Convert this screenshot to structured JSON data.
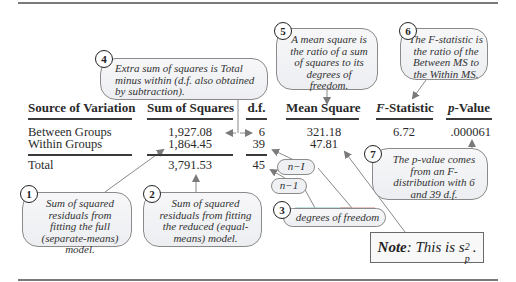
{
  "table": {
    "headers": {
      "source": "Source of Variation",
      "ss": "Sum of Squares",
      "df": "d.f.",
      "ms": "Mean Square",
      "f_prefix": "F",
      "f_suffix": "-Statistic",
      "p_prefix": "p",
      "p_suffix": "-Value"
    },
    "rows": [
      {
        "source": "Between Groups",
        "ss": "1,927.08",
        "df": "6",
        "ms": "321.18",
        "f": "6.72",
        "p": ".000061"
      },
      {
        "source": "Within Groups",
        "ss": "1,864.45",
        "df": "39",
        "ms": "47.81",
        "f": "",
        "p": ""
      }
    ],
    "total": {
      "source": "Total",
      "ss": "3,791.53",
      "df": "45"
    }
  },
  "callouts": [
    {
      "num": "1",
      "text": "Sum of squared residuals from fitting the full (separate-means) model."
    },
    {
      "num": "2",
      "text": "Sum of squared residuals from fitting the reduced (equal-means) model."
    },
    {
      "num": "3",
      "text": "degrees of freedom"
    },
    {
      "num": "4",
      "text": "Extra sum of squares is Total minus within (d.f. also obtained by subtraction)."
    },
    {
      "num": "5",
      "text": "A mean square is the ratio of a sum of squares to its degrees of freedom."
    },
    {
      "num": "6",
      "text": "The F-statistic is the ratio of the Between MS to the Within MS."
    },
    {
      "num": "7",
      "text": "The p-value comes from an F-distribution with 6 and 39 d.f."
    }
  ],
  "pills": {
    "n_minus_I": "n−I",
    "n_minus_1": "n−1"
  },
  "note": {
    "label": "Note",
    "text": ": This is s",
    "sub": "p",
    "sup": "2",
    "end": "."
  }
}
